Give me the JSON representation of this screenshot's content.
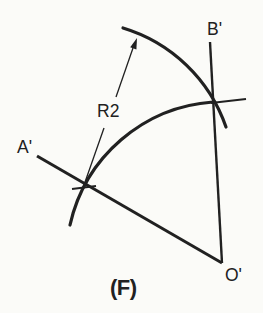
{
  "figure": {
    "caption": "(F)",
    "labels": {
      "point_a": "A'",
      "point_b": "B'",
      "point_o": "O'",
      "radius": "R2"
    },
    "colors": {
      "line": "#212121",
      "background": "#fbfbf8"
    }
  }
}
